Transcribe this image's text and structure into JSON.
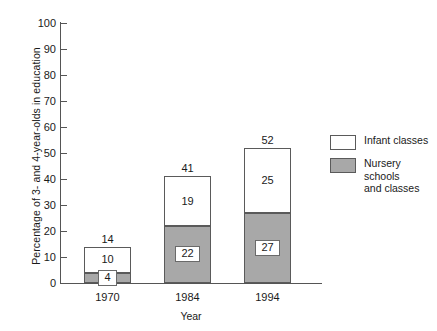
{
  "chart_data": {
    "type": "bar",
    "subtype": "stacked-vertical",
    "title": "",
    "xlabel": "Year",
    "ylabel": "Percentage of 3- and 4-year-olds in education",
    "categories": [
      "1970",
      "1984",
      "1994"
    ],
    "ylim": [
      0,
      100
    ],
    "yticks": [
      0,
      10,
      20,
      30,
      40,
      50,
      60,
      70,
      80,
      90,
      100
    ],
    "ytick_labels": [
      "0",
      "10",
      "20",
      "30",
      "40",
      "50",
      "60",
      "70",
      "80",
      "90",
      "100"
    ],
    "grid": false,
    "legend_position": "right",
    "series": [
      {
        "name": "Nursery schools and classes",
        "color": "#a8a8a8",
        "values": [
          4,
          22,
          27
        ],
        "value_labels": [
          "4",
          "22",
          "27"
        ]
      },
      {
        "name": "Infant classes",
        "color": "#ffffff",
        "values": [
          10,
          19,
          25
        ],
        "value_labels": [
          "10",
          "19",
          "25"
        ]
      }
    ],
    "totals": [
      14,
      41,
      52
    ],
    "total_labels": [
      "14",
      "41",
      "52"
    ]
  },
  "legend": {
    "items": [
      {
        "label": "Infant classes",
        "swatch": "white"
      },
      {
        "label": "Nursery schools\nand classes",
        "swatch": "gray"
      }
    ]
  },
  "colors": {
    "nursery_fill": "#a8a8a8",
    "infant_fill": "#ffffff",
    "bar_border": "#5a5a5a",
    "axis": "#555555",
    "text": "#1a1a1a",
    "background": "#ffffff"
  }
}
